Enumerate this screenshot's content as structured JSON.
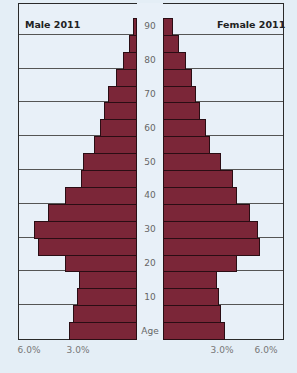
{
  "chart_data": {
    "type": "bar",
    "subtype": "population-pyramid",
    "titles": {
      "left": "Male 2011",
      "right": "Female 2011"
    },
    "categories": [
      "0-4",
      "5-9",
      "10-14",
      "15-19",
      "20-24",
      "25-29",
      "30-34",
      "35-39",
      "40-44",
      "45-49",
      "50-54",
      "55-59",
      "60-64",
      "65-69",
      "70-74",
      "75-79",
      "80-84",
      "85-89",
      "90+"
    ],
    "series": [
      {
        "name": "Male 2011",
        "values": [
          3.5,
          3.3,
          3.1,
          3.0,
          3.7,
          5.1,
          5.3,
          4.6,
          3.7,
          2.9,
          2.8,
          2.2,
          1.9,
          1.7,
          1.5,
          1.1,
          0.7,
          0.4,
          0.2
        ]
      },
      {
        "name": "Female 2011",
        "values": [
          3.2,
          3.0,
          2.9,
          2.8,
          3.8,
          5.0,
          4.9,
          4.5,
          3.8,
          3.6,
          3.0,
          2.4,
          2.2,
          1.9,
          1.7,
          1.5,
          1.2,
          0.8,
          0.5
        ]
      }
    ],
    "age_axis_labels": [
      "Age",
      "10",
      "20",
      "30",
      "40",
      "50",
      "60",
      "70",
      "80",
      "90"
    ],
    "x_tick_labels": {
      "left": [
        "6.0%",
        "3.0%"
      ],
      "right": [
        "3.0%",
        "6.0%"
      ]
    },
    "xlim": [
      0,
      6.5
    ],
    "xlabel": "",
    "ylabel": "Age",
    "grid": true,
    "bar_color": "#7b2638",
    "legend": "none"
  }
}
